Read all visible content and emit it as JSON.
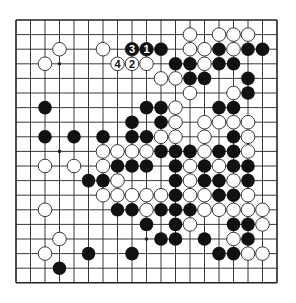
{
  "board": {
    "size": 19,
    "origin": [
      16,
      20
    ],
    "spacing": [
      14.5,
      14.6
    ],
    "stone_radius": 6.8,
    "colors": {
      "line": "#222222",
      "black": "#111111",
      "white": "#ffffff",
      "background": "#ffffff"
    },
    "star_points": [
      [
        3,
        3
      ],
      [
        9,
        3
      ],
      [
        15,
        3
      ],
      [
        3,
        9
      ],
      [
        9,
        9
      ],
      [
        15,
        9
      ],
      [
        3,
        15
      ],
      [
        9,
        15
      ],
      [
        15,
        15
      ]
    ],
    "black": [
      [
        10,
        2
      ],
      [
        14,
        2
      ],
      [
        16,
        2
      ],
      [
        17,
        2
      ],
      [
        11,
        3
      ],
      [
        12,
        3
      ],
      [
        14,
        3
      ],
      [
        15,
        3
      ],
      [
        12,
        4
      ],
      [
        13,
        4
      ],
      [
        16,
        4
      ],
      [
        16,
        5
      ],
      [
        2,
        6
      ],
      [
        9,
        6
      ],
      [
        10,
        6
      ],
      [
        14,
        6
      ],
      [
        15,
        6
      ],
      [
        8,
        7
      ],
      [
        10,
        7
      ],
      [
        2,
        8
      ],
      [
        4,
        8
      ],
      [
        6,
        8
      ],
      [
        8,
        8
      ],
      [
        9,
        8
      ],
      [
        15,
        8
      ],
      [
        10,
        9
      ],
      [
        11,
        9
      ],
      [
        12,
        9
      ],
      [
        14,
        9
      ],
      [
        15,
        9
      ],
      [
        7,
        10
      ],
      [
        8,
        10
      ],
      [
        9,
        10
      ],
      [
        11,
        10
      ],
      [
        13,
        10
      ],
      [
        15,
        10
      ],
      [
        16,
        10
      ],
      [
        5,
        11
      ],
      [
        6,
        11
      ],
      [
        11,
        11
      ],
      [
        13,
        11
      ],
      [
        14,
        11
      ],
      [
        16,
        11
      ],
      [
        11,
        12
      ],
      [
        14,
        12
      ],
      [
        15,
        12
      ],
      [
        7,
        13
      ],
      [
        8,
        13
      ],
      [
        10,
        13
      ],
      [
        11,
        13
      ],
      [
        12,
        13
      ],
      [
        9,
        14
      ],
      [
        11,
        14
      ],
      [
        15,
        14
      ],
      [
        16,
        14
      ],
      [
        10,
        15
      ],
      [
        11,
        15
      ],
      [
        13,
        15
      ],
      [
        16,
        15
      ],
      [
        5,
        16
      ],
      [
        8,
        16
      ],
      [
        14,
        16
      ],
      [
        15,
        16
      ],
      [
        3,
        17
      ]
    ],
    "white": [
      [
        12,
        1
      ],
      [
        14,
        1
      ],
      [
        15,
        1
      ],
      [
        16,
        1
      ],
      [
        3,
        2
      ],
      [
        6,
        2
      ],
      [
        12,
        2
      ],
      [
        13,
        2
      ],
      [
        15,
        2
      ],
      [
        2,
        3
      ],
      [
        9,
        3
      ],
      [
        13,
        3
      ],
      [
        10,
        4
      ],
      [
        11,
        4
      ],
      [
        12,
        5
      ],
      [
        15,
        5
      ],
      [
        11,
        6
      ],
      [
        11,
        7
      ],
      [
        13,
        7
      ],
      [
        14,
        7
      ],
      [
        15,
        7
      ],
      [
        16,
        7
      ],
      [
        10,
        8
      ],
      [
        11,
        8
      ],
      [
        13,
        8
      ],
      [
        16,
        8
      ],
      [
        6,
        9
      ],
      [
        7,
        9
      ],
      [
        8,
        9
      ],
      [
        9,
        9
      ],
      [
        13,
        9
      ],
      [
        16,
        9
      ],
      [
        4,
        10
      ],
      [
        2,
        10
      ],
      [
        6,
        10
      ],
      [
        12,
        10
      ],
      [
        14,
        10
      ],
      [
        7,
        11
      ],
      [
        12,
        11
      ],
      [
        15,
        11
      ],
      [
        6,
        12
      ],
      [
        7,
        12
      ],
      [
        8,
        12
      ],
      [
        9,
        12
      ],
      [
        10,
        12
      ],
      [
        12,
        12
      ],
      [
        13,
        12
      ],
      [
        16,
        12
      ],
      [
        9,
        13
      ],
      [
        13,
        13
      ],
      [
        14,
        13
      ],
      [
        15,
        13
      ],
      [
        16,
        13
      ],
      [
        17,
        13
      ],
      [
        2,
        13
      ],
      [
        12,
        14
      ],
      [
        17,
        14
      ],
      [
        3,
        15
      ],
      [
        15,
        15
      ],
      [
        2,
        16
      ],
      [
        16,
        16
      ],
      [
        17,
        16
      ]
    ],
    "numbered": [
      {
        "label": "1",
        "color": "black",
        "pos": [
          9,
          2
        ]
      },
      {
        "label": "2",
        "color": "white",
        "pos": [
          8,
          3
        ]
      },
      {
        "label": "3",
        "color": "black",
        "pos": [
          8,
          2
        ]
      },
      {
        "label": "4",
        "color": "white",
        "pos": [
          7,
          3
        ]
      }
    ]
  }
}
